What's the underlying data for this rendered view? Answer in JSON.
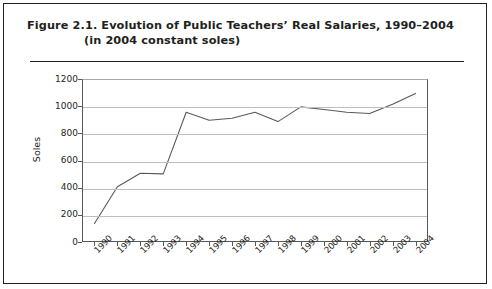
{
  "figure": {
    "title_line_1": "Figure 2.1.  Evolution of Public Teachers’ Real Salaries, 1990–2004",
    "title_line_2": "(in 2004 constant soles)"
  },
  "chart_data": {
    "type": "line",
    "title": "Figure 2.1.  Evolution of Public Teachers’ Real Salaries, 1990–2004 (in 2004 constant soles)",
    "xlabel": "",
    "ylabel": "Soles",
    "categories": [
      "1990",
      "1991",
      "1992",
      "1993",
      "1994",
      "1995",
      "1996",
      "1997",
      "1998",
      "1999",
      "2000",
      "2001",
      "2002",
      "2003",
      "2004"
    ],
    "values": [
      130,
      405,
      505,
      500,
      960,
      900,
      915,
      960,
      890,
      1000,
      980,
      960,
      950,
      1020,
      1100
    ],
    "series": [
      {
        "name": "Real salary",
        "values": [
          130,
          405,
          505,
          500,
          960,
          900,
          915,
          960,
          890,
          1000,
          980,
          960,
          950,
          1020,
          1100
        ]
      }
    ],
    "ylim": [
      0,
      1200
    ],
    "yticks": [
      0,
      200,
      400,
      600,
      800,
      1000,
      1200
    ],
    "ytick_labels": [
      "0",
      "200",
      "400",
      "600",
      "800",
      "1000",
      "1200"
    ],
    "grid": "horizontal",
    "legend": "none",
    "line_color": "#58595b",
    "grid_color": "#bcbec0",
    "axis_color": "#58595b"
  }
}
